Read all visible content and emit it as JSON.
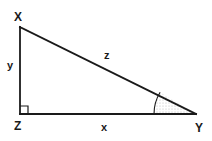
{
  "figure": {
    "kind": "right-triangle-diagram",
    "background_color": "#ffffff",
    "stroke_color": "#1a1a1a",
    "shade_color": "#cfcfcf",
    "vertices": {
      "x": {
        "label": "X",
        "position": [
          20,
          27
        ]
      },
      "z": {
        "label": "Z",
        "position": [
          20,
          114
        ]
      },
      "y": {
        "label": "Y",
        "position": [
          196,
          114
        ]
      }
    },
    "sides": {
      "leg_vertical": {
        "label": "y",
        "from": "X",
        "to": "Z"
      },
      "leg_horizontal": {
        "label": "x",
        "from": "Z",
        "to": "Y"
      },
      "hypotenuse": {
        "label": "z",
        "from": "X",
        "to": "Y"
      }
    },
    "markers": {
      "right_angle": {
        "at": "Z",
        "name": "right-angle-square",
        "size": 8
      },
      "shaded_angle": {
        "at": "Y",
        "name": "angle-sector",
        "radius": 42,
        "fill": "stipple"
      }
    }
  }
}
